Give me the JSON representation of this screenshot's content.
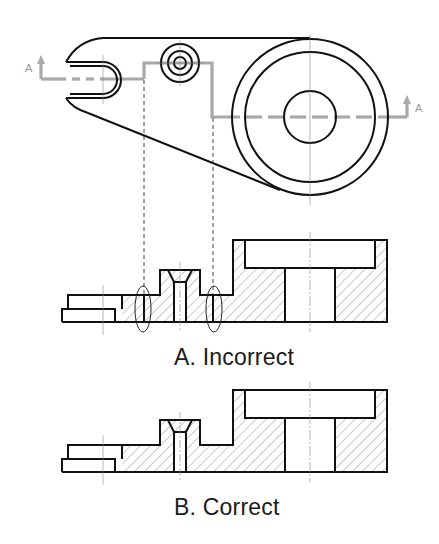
{
  "figure": {
    "top_view": {
      "section_markers": [
        {
          "label": "A",
          "position": "left"
        },
        {
          "label": "A",
          "position": "right"
        }
      ]
    },
    "sections": [
      {
        "id": "A",
        "caption": "A. Incorrect",
        "status": "incorrect"
      },
      {
        "id": "B",
        "caption": "B. Correct",
        "status": "correct"
      }
    ],
    "colors": {
      "outline": "#111111",
      "cutting_plane": "#a8a8a8",
      "hatch": "#7a7a7a",
      "background": "#ffffff"
    }
  }
}
